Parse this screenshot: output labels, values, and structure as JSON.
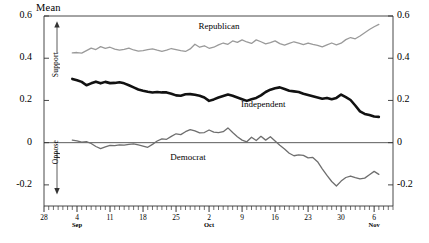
{
  "chart_data": {
    "type": "line",
    "title": "",
    "ylabel": "Mean",
    "xlabel": "",
    "ylim": [
      -0.3,
      0.6
    ],
    "grid": false,
    "legend_position": "inline-annotations",
    "yticks": [
      "0.6",
      "0.4",
      "0.2",
      "0",
      "-0.2"
    ],
    "ytick_values": [
      0.6,
      0.4,
      0.2,
      0,
      -0.2
    ],
    "xticks": [
      {
        "label": "28",
        "month": "",
        "x": 0
      },
      {
        "label": "4",
        "month": "Sep",
        "x": 7
      },
      {
        "label": "11",
        "month": "",
        "x": 14
      },
      {
        "label": "18",
        "month": "",
        "x": 21
      },
      {
        "label": "25",
        "month": "",
        "x": 28
      },
      {
        "label": "2",
        "month": "Oct",
        "x": 35
      },
      {
        "label": "9",
        "month": "",
        "x": 42
      },
      {
        "label": "16",
        "month": "",
        "x": 49
      },
      {
        "label": "23",
        "month": "",
        "x": 56
      },
      {
        "label": "30",
        "month": "",
        "x": 63
      },
      {
        "label": "6",
        "month": "Nov",
        "x": 70
      }
    ],
    "xlim": [
      0,
      74
    ],
    "annotations": [
      {
        "name": "support-arrow-label",
        "text": "Support",
        "direction": "up"
      },
      {
        "name": "oppose-arrow-label",
        "text": "Oppose",
        "direction": "down"
      }
    ],
    "series": [
      {
        "name": "Republican",
        "color": "#9a9a9a",
        "width": 1.3,
        "label_x": 37,
        "label_y": 0.545,
        "x": [
          6,
          7,
          8,
          9,
          10,
          11,
          12,
          13,
          14,
          15,
          16,
          17,
          18,
          19,
          20,
          21,
          22,
          23,
          24,
          25,
          26,
          27,
          28,
          29,
          30,
          31,
          32,
          33,
          34,
          35,
          36,
          37,
          38,
          39,
          40,
          41,
          42,
          43,
          44,
          45,
          46,
          47,
          48,
          49,
          50,
          51,
          52,
          53,
          54,
          55,
          56,
          57,
          58,
          59,
          60,
          61,
          62,
          63,
          64,
          65,
          66,
          67,
          68,
          69,
          70,
          71
        ],
        "values": [
          0.425,
          0.427,
          0.424,
          0.436,
          0.448,
          0.441,
          0.455,
          0.447,
          0.452,
          0.443,
          0.438,
          0.442,
          0.448,
          0.439,
          0.434,
          0.436,
          0.441,
          0.444,
          0.438,
          0.433,
          0.438,
          0.446,
          0.441,
          0.436,
          0.432,
          0.444,
          0.466,
          0.452,
          0.459,
          0.447,
          0.452,
          0.463,
          0.472,
          0.466,
          0.482,
          0.475,
          0.487,
          0.477,
          0.47,
          0.487,
          0.478,
          0.468,
          0.474,
          0.482,
          0.469,
          0.462,
          0.47,
          0.478,
          0.471,
          0.464,
          0.472,
          0.466,
          0.461,
          0.454,
          0.463,
          0.472,
          0.463,
          0.471,
          0.488,
          0.498,
          0.492,
          0.505,
          0.521,
          0.536,
          0.549,
          0.56
        ]
      },
      {
        "name": "Independent",
        "color": "#111111",
        "width": 2.6,
        "label_x": 46,
        "label_y": 0.175,
        "x": [
          6,
          7,
          8,
          9,
          10,
          11,
          12,
          13,
          14,
          15,
          16,
          17,
          18,
          19,
          20,
          21,
          22,
          23,
          24,
          25,
          26,
          27,
          28,
          29,
          30,
          31,
          32,
          33,
          34,
          35,
          36,
          37,
          38,
          39,
          40,
          41,
          42,
          43,
          44,
          45,
          46,
          47,
          48,
          49,
          50,
          51,
          52,
          53,
          54,
          55,
          56,
          57,
          58,
          59,
          60,
          61,
          62,
          63,
          64,
          65,
          66,
          67,
          68,
          69,
          70,
          71
        ],
        "values": [
          0.302,
          0.296,
          0.288,
          0.272,
          0.281,
          0.289,
          0.281,
          0.288,
          0.282,
          0.283,
          0.286,
          0.281,
          0.272,
          0.262,
          0.252,
          0.246,
          0.241,
          0.238,
          0.24,
          0.238,
          0.238,
          0.232,
          0.224,
          0.222,
          0.229,
          0.23,
          0.227,
          0.222,
          0.214,
          0.198,
          0.205,
          0.214,
          0.221,
          0.228,
          0.222,
          0.214,
          0.206,
          0.198,
          0.206,
          0.212,
          0.224,
          0.24,
          0.251,
          0.258,
          0.262,
          0.254,
          0.246,
          0.243,
          0.24,
          0.232,
          0.226,
          0.22,
          0.214,
          0.208,
          0.212,
          0.206,
          0.212,
          0.228,
          0.216,
          0.202,
          0.176,
          0.148,
          0.136,
          0.131,
          0.124,
          0.122
        ]
      },
      {
        "name": "Democrat",
        "color": "#6e6e6e",
        "width": 1.3,
        "label_x": 31,
        "label_y": -0.075,
        "x": [
          6,
          7,
          8,
          9,
          10,
          11,
          12,
          13,
          14,
          15,
          16,
          17,
          18,
          19,
          20,
          21,
          22,
          23,
          24,
          25,
          26,
          27,
          28,
          29,
          30,
          31,
          32,
          33,
          34,
          35,
          36,
          37,
          38,
          39,
          40,
          41,
          42,
          43,
          44,
          45,
          46,
          47,
          48,
          49,
          50,
          51,
          52,
          53,
          54,
          55,
          56,
          57,
          58,
          59,
          60,
          61,
          62,
          63,
          64,
          65,
          66,
          67,
          68,
          69,
          70,
          71
        ],
        "values": [
          0.012,
          0.008,
          0.002,
          0.005,
          -0.004,
          -0.018,
          -0.028,
          -0.02,
          -0.013,
          -0.014,
          -0.01,
          -0.012,
          -0.008,
          -0.006,
          -0.011,
          -0.016,
          -0.022,
          -0.008,
          0.008,
          0.018,
          0.016,
          0.03,
          0.042,
          0.038,
          0.052,
          0.062,
          0.056,
          0.046,
          0.048,
          0.06,
          0.05,
          0.048,
          0.052,
          0.07,
          0.048,
          0.028,
          0.012,
          0.004,
          0.026,
          0.01,
          0.03,
          0.012,
          0.028,
          0.008,
          -0.012,
          -0.03,
          -0.05,
          -0.062,
          -0.058,
          -0.06,
          -0.072,
          -0.07,
          -0.09,
          -0.124,
          -0.155,
          -0.184,
          -0.205,
          -0.182,
          -0.165,
          -0.158,
          -0.166,
          -0.172,
          -0.168,
          -0.152,
          -0.136,
          -0.15
        ]
      }
    ]
  }
}
